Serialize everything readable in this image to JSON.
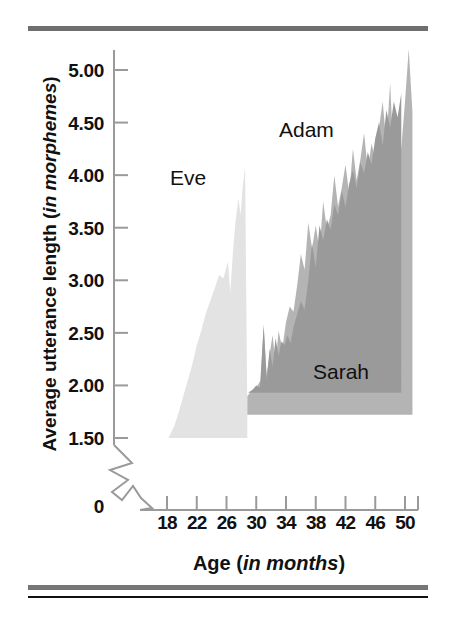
{
  "figure": {
    "y_axis_title_main": "Average utterance length (",
    "y_axis_title_italic": "in morphemes",
    "y_axis_title_close": ")",
    "x_axis_title_main": "Age (",
    "x_axis_title_italic": "in months",
    "x_axis_title_close": ")"
  },
  "chart_data": {
    "type": "area",
    "title": "",
    "xlabel": "Age (in months)",
    "ylabel": "Average utterance length (in morphemes)",
    "xlim": [
      16,
      52
    ],
    "ylim": [
      1.5,
      5.25
    ],
    "y_axis_break": true,
    "y_axis_break_note": "zigzag break between 0 and 1.50",
    "grid": false,
    "legend": "inline-labels",
    "xticks": [
      18,
      22,
      26,
      30,
      34,
      38,
      42,
      46,
      50
    ],
    "xtick_labels": [
      "18",
      "22",
      "26",
      "30",
      "34",
      "38",
      "42",
      "46",
      "50"
    ],
    "yticks": [
      1.5,
      2.0,
      2.5,
      3.0,
      3.5,
      4.0,
      4.5,
      5.0
    ],
    "ytick_labels": [
      "1.50",
      "2.00",
      "2.50",
      "3.00",
      "3.50",
      "4.00",
      "4.50",
      "5.00"
    ],
    "y_origin_label": "0",
    "colors": {
      "eve": "#e3e3e3",
      "adam": "#b4b4b4",
      "sarah": "#9a9a9a",
      "axis": "#9a9a9a",
      "text": "#111111",
      "rule": "#6e6e6e"
    },
    "series": [
      {
        "name": "Eve",
        "color": "#e3e3e3",
        "baseline": 1.5,
        "x": [
          18.2,
          19.0,
          19.6,
          20.2,
          20.8,
          21.4,
          22.0,
          22.6,
          23.2,
          23.8,
          24.4,
          25.0,
          25.6,
          26.2,
          26.5,
          26.9,
          27.2,
          27.6,
          27.9,
          28.2,
          28.5,
          28.8
        ],
        "values": [
          1.5,
          1.62,
          1.75,
          1.9,
          2.05,
          2.2,
          2.38,
          2.52,
          2.68,
          2.8,
          2.92,
          3.05,
          3.02,
          3.18,
          2.88,
          3.3,
          3.55,
          3.78,
          3.62,
          3.9,
          4.08,
          1.72
        ]
      },
      {
        "name": "Adam",
        "color": "#b4b4b4",
        "baseline": 1.72,
        "x": [
          28.8,
          29.4,
          30.0,
          30.6,
          31.0,
          31.4,
          31.8,
          32.2,
          32.6,
          33.0,
          33.5,
          34.0,
          34.5,
          35.0,
          35.5,
          36.0,
          36.5,
          37.0,
          37.5,
          38.0,
          38.5,
          39.0,
          39.5,
          40.0,
          40.5,
          41.0,
          41.5,
          42.0,
          42.5,
          43.0,
          43.5,
          44.0,
          44.5,
          45.0,
          45.5,
          46.0,
          46.5,
          47.0,
          47.5,
          48.0,
          48.5,
          49.0,
          49.5,
          50.0,
          50.5,
          51.0
        ],
        "values": [
          1.9,
          1.95,
          1.98,
          2.05,
          2.55,
          2.1,
          2.3,
          2.48,
          2.2,
          2.52,
          2.35,
          2.6,
          2.75,
          2.7,
          2.95,
          3.25,
          3.1,
          3.55,
          3.3,
          3.52,
          3.28,
          3.75,
          3.48,
          3.62,
          4.0,
          3.7,
          3.88,
          4.1,
          3.82,
          4.25,
          3.95,
          4.15,
          4.4,
          4.05,
          4.3,
          4.15,
          4.45,
          4.7,
          4.3,
          4.88,
          4.1,
          4.45,
          4.25,
          4.7,
          5.2,
          4.6
        ]
      },
      {
        "name": "Sarah",
        "color": "#9a9a9a",
        "baseline": 1.93,
        "x": [
          28.9,
          29.5,
          30.0,
          30.5,
          31.0,
          31.4,
          31.8,
          32.2,
          32.6,
          33.0,
          33.4,
          33.8,
          34.2,
          34.6,
          35.0,
          35.5,
          36.0,
          36.5,
          37.0,
          37.5,
          38.0,
          38.5,
          39.0,
          39.5,
          40.0,
          40.5,
          41.0,
          41.5,
          42.0,
          42.5,
          43.0,
          43.5,
          44.0,
          44.5,
          45.0,
          45.5,
          46.0,
          46.5,
          47.0,
          47.5,
          48.0,
          48.5,
          49.0,
          49.5
        ],
        "values": [
          1.93,
          1.96,
          2.0,
          1.98,
          2.58,
          2.05,
          2.35,
          2.18,
          2.45,
          2.28,
          2.42,
          2.38,
          2.48,
          2.4,
          2.55,
          2.68,
          2.8,
          2.72,
          3.0,
          3.35,
          3.12,
          3.52,
          3.38,
          3.58,
          3.48,
          3.72,
          3.62,
          3.85,
          3.7,
          3.92,
          4.05,
          3.88,
          4.12,
          4.02,
          4.22,
          4.1,
          4.35,
          4.5,
          4.28,
          4.62,
          4.45,
          4.7,
          4.55,
          4.78
        ]
      }
    ],
    "annotations": [
      {
        "text": "Eve",
        "x": 21.5,
        "y": 4.05
      },
      {
        "text": "Adam",
        "x": 36.5,
        "y": 4.5
      },
      {
        "text": "Sarah",
        "x": 41.5,
        "y": 2.3
      }
    ]
  }
}
